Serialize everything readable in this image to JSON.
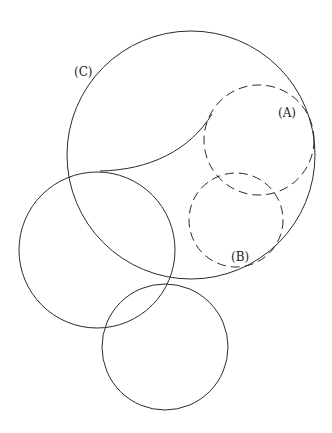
{
  "diagram": {
    "labels": {
      "c": "(C)",
      "a": "(A)",
      "b": "(B)"
    },
    "colors": {
      "stroke": "#2a2a2a",
      "background": "#ffffff"
    },
    "circles": [
      {
        "name": "circle-c",
        "cx": 191,
        "cy": 155,
        "r": 124,
        "style": "solid"
      },
      {
        "name": "circle-a",
        "cx": 259,
        "cy": 140,
        "r": 55,
        "style": "dashed"
      },
      {
        "name": "circle-b",
        "cx": 236,
        "cy": 220,
        "r": 47,
        "style": "dashed"
      },
      {
        "name": "circle-left",
        "cx": 97,
        "cy": 250,
        "r": 78,
        "style": "solid"
      },
      {
        "name": "circle-bottom",
        "cx": 165,
        "cy": 347,
        "r": 63,
        "style": "solid"
      }
    ]
  }
}
